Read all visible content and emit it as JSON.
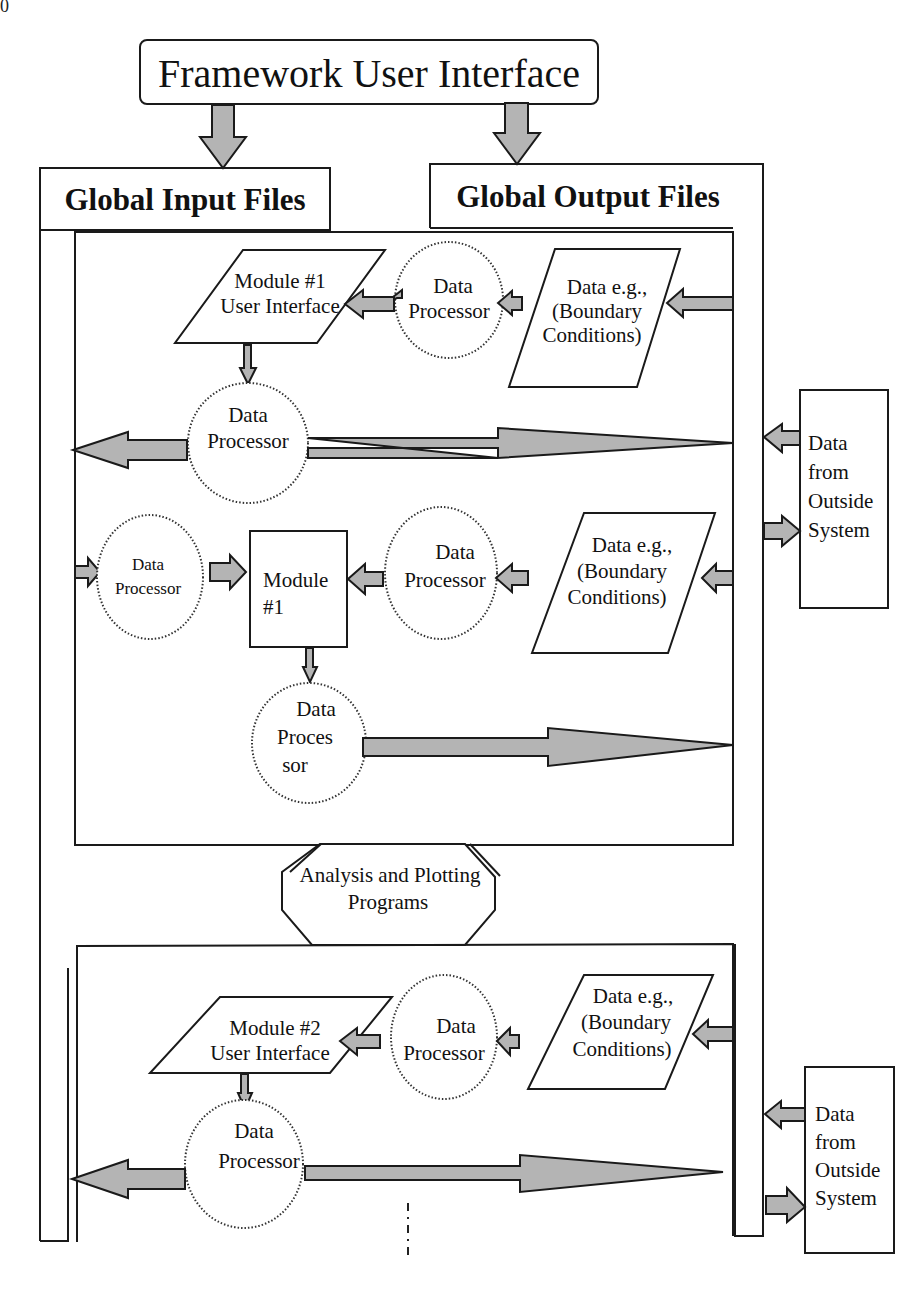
{
  "page": {
    "page_number_fragment": "0"
  },
  "diagram": {
    "title": "Framework User Interface",
    "global_input": "Global Input Files",
    "global_output": "Global Output Files",
    "module1": {
      "ui_line1": "Module  #1",
      "ui_line2": "User Interface",
      "dp_top_line1": "Data",
      "dp_top_line2": "Processor",
      "data_line1": "Data e.g.,",
      "data_line2": "(Boundary",
      "data_line3": "Conditions)",
      "dp_mid_line1": "Data",
      "dp_mid_line2": "Processor",
      "outside_line1": "Data",
      "outside_line2": "from",
      "outside_line3": "Outside",
      "outside_line4": "System",
      "dp_left_line1": "Data",
      "dp_left_line2": "Processor",
      "module_box_line1": "Module",
      "module_box_line2": "#1",
      "dp_row2_line1": "Data",
      "dp_row2_line2": "Processor",
      "data2_line1": "Data e.g.,",
      "data2_line2": "(Boundary",
      "data2_line3": "Conditions)",
      "dp_bottom_line1": "Data",
      "dp_bottom_line2": "Proces",
      "dp_bottom_line3": "sor"
    },
    "analysis": {
      "line1": "Analysis and Plotting",
      "line2": "Programs"
    },
    "module2": {
      "ui_line1": "Module  #2",
      "ui_line2": "User Interface",
      "dp_top_line1": "Data",
      "dp_top_line2": "Processor",
      "data_line1": "Data e.g.,",
      "data_line2": "(Boundary",
      "data_line3": "Conditions)",
      "dp_mid_line1": "Data",
      "dp_mid_line2": "Processor",
      "outside_line1": "Data",
      "outside_line2": "from",
      "outside_line3": "Outside",
      "outside_line4": "System"
    },
    "colors": {
      "arrow_fill": "#b4b4b4",
      "stroke": "#1a1a1a",
      "background": "#ffffff"
    }
  }
}
